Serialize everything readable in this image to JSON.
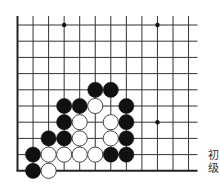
{
  "board": {
    "cols": 12,
    "rows": 10,
    "origin_x": 17.5,
    "origin_y": 25,
    "spacing_x": 15.55,
    "spacing_y": 16.2,
    "top_extension": 9,
    "right_extension": 9,
    "open_top": true,
    "open_right": true,
    "line_color": "#333333",
    "edge_color": "#222222",
    "star_points": [
      [
        3,
        0
      ],
      [
        9,
        0
      ],
      [
        9,
        6
      ]
    ],
    "stone_radius": 7.6,
    "colors": {
      "black": "#111111",
      "white_fill": "#ffffff",
      "white_stroke": "#444444"
    },
    "stones": [
      {
        "c": 5,
        "r": 4,
        "color": "black"
      },
      {
        "c": 6,
        "r": 4,
        "color": "black"
      },
      {
        "c": 3,
        "r": 5,
        "color": "black"
      },
      {
        "c": 4,
        "r": 5,
        "color": "black"
      },
      {
        "c": 5,
        "r": 5,
        "color": "white"
      },
      {
        "c": 7,
        "r": 5,
        "color": "black"
      },
      {
        "c": 3,
        "r": 6,
        "color": "black"
      },
      {
        "c": 4,
        "r": 6,
        "color": "white"
      },
      {
        "c": 6,
        "r": 6,
        "color": "white"
      },
      {
        "c": 7,
        "r": 6,
        "color": "black"
      },
      {
        "c": 2,
        "r": 7,
        "color": "black"
      },
      {
        "c": 3,
        "r": 7,
        "color": "black"
      },
      {
        "c": 4,
        "r": 7,
        "color": "white"
      },
      {
        "c": 6,
        "r": 7,
        "color": "white"
      },
      {
        "c": 7,
        "r": 7,
        "color": "black"
      },
      {
        "c": 1,
        "r": 8,
        "color": "black"
      },
      {
        "c": 2,
        "r": 8,
        "color": "white"
      },
      {
        "c": 3,
        "r": 8,
        "color": "white"
      },
      {
        "c": 4,
        "r": 8,
        "color": "white"
      },
      {
        "c": 5,
        "r": 8,
        "color": "white"
      },
      {
        "c": 6,
        "r": 8,
        "color": "black"
      },
      {
        "c": 7,
        "r": 8,
        "color": "black"
      },
      {
        "c": 1,
        "r": 9,
        "color": "black"
      },
      {
        "c": 2,
        "r": 9,
        "color": "white"
      }
    ]
  },
  "caption": {
    "line1": "初",
    "line2": "级"
  }
}
